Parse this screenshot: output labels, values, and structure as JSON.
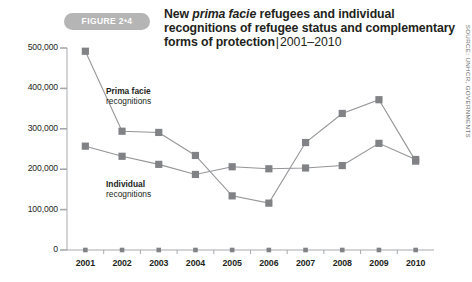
{
  "figure": {
    "badge_label": "FIGURE 2•4",
    "title_part1": "New ",
    "title_italic": "prima facie",
    "title_part2": " refugees and individual recognitions of refugee status and complementary forms of protection",
    "title_separator": "|",
    "title_years": "2001–2010",
    "source": "SOURCE: UNHCR, GOVERNMENTS"
  },
  "chart_data": {
    "type": "line",
    "xlabel": "",
    "ylabel": "",
    "categories": [
      "2001",
      "2002",
      "2003",
      "2004",
      "2005",
      "2006",
      "2007",
      "2008",
      "2009",
      "2010"
    ],
    "x_tick_labels": [
      "2001",
      "2002",
      "2003",
      "2004",
      "2005",
      "2006",
      "2007",
      "2008",
      "2009",
      "2010"
    ],
    "y_tick_labels": [
      "0",
      "100,000",
      "200,000",
      "300,000",
      "400,000",
      "500,000"
    ],
    "y_tick_values": [
      0,
      100000,
      200000,
      300000,
      400000,
      500000
    ],
    "ylim": [
      0,
      500000
    ],
    "grid": false,
    "legend": "inline-annotations",
    "series": [
      {
        "name": "Prima facie recognitions",
        "label_line1": "Prima facie",
        "label_line2": "recognitions",
        "color": "#808285",
        "values": [
          492000,
          294000,
          291000,
          234000,
          134000,
          116000,
          266000,
          338000,
          372000,
          220000
        ]
      },
      {
        "name": "Individual recognitions",
        "label_line1": "Individual",
        "label_line2": "recognitions",
        "color": "#808285",
        "values": [
          257000,
          232000,
          212000,
          187000,
          206000,
          201000,
          203000,
          209000,
          264000,
          224000
        ]
      }
    ]
  },
  "colors": {
    "badge": "#b5b5b5",
    "line": "#939598",
    "marker": "#808285",
    "axis": "#a7a9ac",
    "text": "#231f20",
    "source_text": "#6d6e71"
  }
}
